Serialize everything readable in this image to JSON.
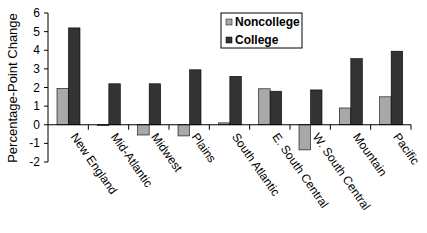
{
  "chart_data": {
    "type": "bar",
    "title": "",
    "xlabel": "",
    "ylabel": "Percentage-Point Change",
    "ylim": [
      -2,
      6
    ],
    "yticks": [
      -2,
      -1,
      0,
      1,
      2,
      3,
      4,
      5,
      6
    ],
    "grid": false,
    "legend_position": "top-right (inside plot)",
    "categories": [
      "New England",
      "Mid-Atlantic",
      "Midwest",
      "Plains",
      "South Atlantic",
      "E. South Central",
      "W. South Central",
      "Mountain",
      "Pacific"
    ],
    "series": [
      {
        "name": "Noncollege",
        "color": "#a8a8a8",
        "values": [
          1.95,
          -0.05,
          -0.55,
          -0.6,
          0.1,
          1.93,
          -1.35,
          0.9,
          1.5
        ]
      },
      {
        "name": "College",
        "color": "#333333",
        "values": [
          5.2,
          2.2,
          2.2,
          2.95,
          2.6,
          1.8,
          1.87,
          3.55,
          3.95
        ]
      }
    ]
  },
  "legend": {
    "items": [
      {
        "label": "Noncollege",
        "color": "#a8a8a8"
      },
      {
        "label": "College",
        "color": "#333333"
      }
    ]
  }
}
